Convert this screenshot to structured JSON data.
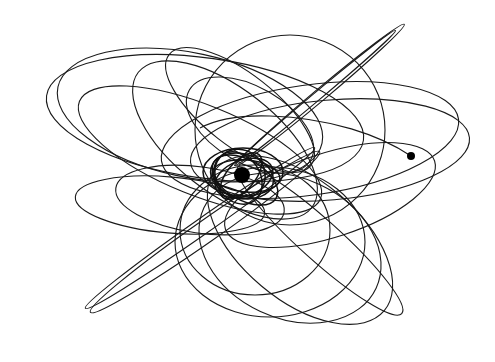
{
  "figure": {
    "width": 495,
    "height": 362,
    "background": "#ffffff",
    "stroke_color": "#1a1a1a"
  },
  "central_body": {
    "cx": 242,
    "cy": 175,
    "r": 8,
    "color": "#000000"
  },
  "satellite": {
    "cx": 411,
    "cy": 156,
    "r": 4,
    "color": "#000000"
  },
  "satellite_tail": "M 411 156 C 380 135, 330 118, 270 116 C 240 115, 215 120, 200 128",
  "orbits": [
    {
      "cx": 190,
      "cy": 115,
      "rx": 135,
      "ry": 62,
      "rot": 12
    },
    {
      "cx": 205,
      "cy": 118,
      "rx": 160,
      "ry": 60,
      "rot": 8
    },
    {
      "cx": 200,
      "cy": 150,
      "rx": 130,
      "ry": 45,
      "rot": 22
    },
    {
      "cx": 225,
      "cy": 140,
      "rx": 110,
      "ry": 52,
      "rot": 38
    },
    {
      "cx": 290,
      "cy": 130,
      "rx": 95,
      "ry": 95,
      "rot": 0
    },
    {
      "cx": 310,
      "cy": 140,
      "rx": 150,
      "ry": 55,
      "rot": -8
    },
    {
      "cx": 330,
      "cy": 150,
      "rx": 140,
      "ry": 50,
      "rot": -5
    },
    {
      "cx": 320,
      "cy": 95,
      "rx": 110,
      "ry": 6,
      "rot": -40
    },
    {
      "cx": 315,
      "cy": 98,
      "rx": 105,
      "ry": 4,
      "rot": -40
    },
    {
      "cx": 200,
      "cy": 228,
      "rx": 140,
      "ry": 8,
      "rot": -35
    },
    {
      "cx": 205,
      "cy": 232,
      "rx": 140,
      "ry": 11,
      "rot": -35
    },
    {
      "cx": 270,
      "cy": 242,
      "rx": 95,
      "ry": 75,
      "rot": 0
    },
    {
      "cx": 290,
      "cy": 248,
      "rx": 95,
      "ry": 70,
      "rot": 25
    },
    {
      "cx": 300,
      "cy": 240,
      "rx": 110,
      "ry": 60,
      "rot": 40
    },
    {
      "cx": 320,
      "cy": 240,
      "rx": 110,
      "ry": 20,
      "rot": 42
    },
    {
      "cx": 170,
      "cy": 205,
      "rx": 95,
      "ry": 28,
      "rot": 5
    },
    {
      "cx": 200,
      "cy": 200,
      "rx": 85,
      "ry": 33,
      "rot": 8
    },
    {
      "cx": 330,
      "cy": 195,
      "rx": 110,
      "ry": 42,
      "rot": -18
    },
    {
      "cx": 240,
      "cy": 110,
      "rx": 90,
      "ry": 36,
      "rot": 38
    },
    {
      "cx": 250,
      "cy": 125,
      "rx": 70,
      "ry": 38,
      "rot": 30
    },
    {
      "cx": 255,
      "cy": 230,
      "rx": 75,
      "ry": 65,
      "rot": 0
    }
  ],
  "core_orbits": [
    {
      "cx": 242,
      "cy": 176,
      "rx": 32,
      "ry": 22,
      "rot": 15
    },
    {
      "cx": 244,
      "cy": 178,
      "rx": 30,
      "ry": 18,
      "rot": -20
    },
    {
      "cx": 240,
      "cy": 174,
      "rx": 26,
      "ry": 24,
      "rot": 40
    },
    {
      "cx": 246,
      "cy": 176,
      "rx": 34,
      "ry": 16,
      "rot": 5
    },
    {
      "cx": 238,
      "cy": 178,
      "rx": 22,
      "ry": 28,
      "rot": -35
    },
    {
      "cx": 243,
      "cy": 172,
      "rx": 40,
      "ry": 24,
      "rot": 0
    },
    {
      "cx": 245,
      "cy": 180,
      "rx": 36,
      "ry": 20,
      "rot": 30
    },
    {
      "cx": 241,
      "cy": 176,
      "rx": 28,
      "ry": 14,
      "rot": -50
    }
  ]
}
